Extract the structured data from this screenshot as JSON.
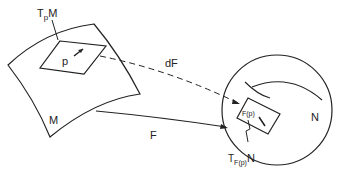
{
  "diagram": {
    "labels": {
      "tangent_space_M": "T",
      "tangent_space_M_sub": "p",
      "tangent_space_M_tail": "M",
      "point_p": "p",
      "manifold_M": "M",
      "differential": "dF",
      "map_F": "F",
      "manifold_N": "N",
      "image_point": "F(p)",
      "tangent_space_N": "T",
      "tangent_space_N_sub": "F(p)",
      "tangent_space_N_tail": "N"
    },
    "colors": {
      "stroke": "#222222",
      "background": "#ffffff"
    }
  }
}
